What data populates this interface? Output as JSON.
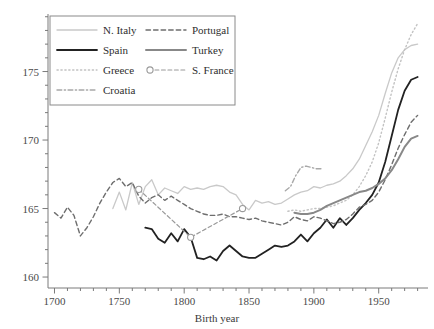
{
  "chart_data": {
    "type": "line",
    "title": "",
    "xlabel": "Birth year",
    "ylabel": "",
    "xlim": [
      1695,
      1988
    ],
    "ylim": [
      159.2,
      179.2
    ],
    "grid": false,
    "legend_position": "top-left",
    "xticks": [
      1700,
      1750,
      1800,
      1850,
      1900,
      1950
    ],
    "xtick_labels": [
      "1700",
      "1750",
      "1800",
      "1850",
      "1900",
      "1950"
    ],
    "xticks_minor_step": 10,
    "yticks": [
      160,
      165,
      170,
      175
    ],
    "ytick_labels": [
      "160",
      "165",
      "170",
      "175"
    ],
    "yticks_minor_step": 1,
    "units": "cm",
    "series": [
      {
        "name": "N. Italy",
        "color": "#c9c9c9",
        "dash": "solid",
        "width": 1.3,
        "marker": "none",
        "x": [
          1745,
          1750,
          1755,
          1760,
          1765,
          1770,
          1775,
          1780,
          1785,
          1790,
          1795,
          1800,
          1805,
          1810,
          1815,
          1820,
          1825,
          1830,
          1835,
          1840,
          1845,
          1850,
          1855,
          1860,
          1865,
          1870,
          1875,
          1880,
          1885,
          1890,
          1895,
          1900,
          1905,
          1910,
          1915,
          1920,
          1925,
          1930,
          1935,
          1940,
          1945,
          1950,
          1955,
          1960,
          1965,
          1970,
          1975,
          1980
        ],
        "y": [
          165.0,
          166.2,
          164.9,
          166.9,
          165.3,
          166.6,
          167.1,
          166.0,
          166.5,
          166.3,
          166.1,
          166.6,
          166.4,
          166.5,
          166.4,
          166.6,
          166.7,
          166.6,
          166.2,
          166.0,
          165.3,
          164.9,
          165.6,
          165.4,
          165.5,
          165.3,
          165.4,
          165.7,
          166.0,
          166.2,
          166.3,
          166.6,
          166.5,
          166.7,
          166.8,
          167.0,
          167.4,
          167.9,
          168.6,
          169.6,
          170.6,
          171.8,
          173.4,
          174.9,
          176.0,
          176.6,
          176.9,
          177.0
        ]
      },
      {
        "name": "Spain",
        "color": "#222222",
        "dash": "solid",
        "width": 1.8,
        "marker": "none",
        "x": [
          1770,
          1775,
          1780,
          1785,
          1790,
          1795,
          1800,
          1805,
          1810,
          1815,
          1820,
          1825,
          1830,
          1835,
          1840,
          1845,
          1850,
          1855,
          1860,
          1865,
          1870,
          1875,
          1880,
          1885,
          1890,
          1895,
          1900,
          1905,
          1910,
          1915,
          1920,
          1925,
          1930,
          1935,
          1940,
          1945,
          1950,
          1955,
          1960,
          1965,
          1970,
          1975,
          1980
        ],
        "y": [
          163.6,
          163.5,
          162.8,
          162.5,
          163.2,
          162.6,
          163.5,
          162.9,
          161.4,
          161.3,
          161.5,
          161.2,
          161.9,
          162.3,
          161.9,
          161.5,
          161.4,
          161.4,
          161.7,
          162.0,
          162.3,
          162.2,
          162.3,
          162.6,
          163.1,
          162.6,
          163.2,
          163.6,
          164.2,
          163.6,
          164.3,
          163.8,
          164.3,
          164.9,
          165.4,
          166.0,
          166.9,
          168.4,
          170.3,
          172.2,
          173.6,
          174.4,
          174.6
        ]
      },
      {
        "name": "Greece",
        "color": "#c2c2c2",
        "dash": "dotted",
        "width": 1.4,
        "marker": "none",
        "x": [
          1880,
          1885,
          1890,
          1895,
          1900,
          1905,
          1910,
          1915,
          1920,
          1925,
          1930,
          1935,
          1940,
          1945,
          1950,
          1955,
          1960,
          1965,
          1970,
          1975,
          1980
        ],
        "y": [
          164.8,
          164.9,
          164.8,
          164.9,
          165.0,
          165.0,
          165.1,
          165.2,
          165.4,
          165.6,
          166.0,
          166.6,
          167.4,
          168.4,
          169.8,
          171.6,
          173.5,
          175.2,
          176.6,
          177.7,
          178.5
        ]
      },
      {
        "name": "Croatia",
        "color": "#a8a8a8",
        "dash": "dashdot",
        "width": 1.4,
        "marker": "none",
        "x": [
          1878,
          1882,
          1886,
          1890,
          1894,
          1898,
          1902,
          1906
        ],
        "y": [
          166.3,
          166.6,
          167.4,
          168.0,
          168.1,
          168.0,
          167.9,
          167.9
        ]
      },
      {
        "name": "Portugal",
        "color": "#6e6e6e",
        "dash": "dashed",
        "width": 1.4,
        "marker": "none",
        "x": [
          1700,
          1705,
          1710,
          1715,
          1720,
          1725,
          1730,
          1735,
          1740,
          1745,
          1750,
          1755,
          1760,
          1765,
          1770,
          1775,
          1780,
          1785,
          1790,
          1795,
          1800,
          1805,
          1810,
          1815,
          1820,
          1825,
          1830,
          1835,
          1840,
          1845,
          1850,
          1855,
          1860,
          1865,
          1870,
          1875,
          1880,
          1885,
          1890,
          1895,
          1900,
          1905,
          1910,
          1915,
          1920,
          1925,
          1930,
          1935,
          1940,
          1945,
          1950,
          1955,
          1960,
          1965,
          1970,
          1975,
          1980
        ],
        "y": [
          164.7,
          164.3,
          165.1,
          164.5,
          163.0,
          163.6,
          164.4,
          165.4,
          166.2,
          166.9,
          167.2,
          166.6,
          166.9,
          165.9,
          165.4,
          165.8,
          166.0,
          165.6,
          165.9,
          165.6,
          165.3,
          165.0,
          164.8,
          164.6,
          164.5,
          164.5,
          164.6,
          164.4,
          164.4,
          164.3,
          164.2,
          164.3,
          164.1,
          164.0,
          163.9,
          163.8,
          164.0,
          164.4,
          164.2,
          164.1,
          164.4,
          164.3,
          164.1,
          163.9,
          164.0,
          164.2,
          164.6,
          165.1,
          165.3,
          165.6,
          166.2,
          167.1,
          168.2,
          169.4,
          170.4,
          171.3,
          171.8
        ]
      },
      {
        "name": "Turkey",
        "color": "#888888",
        "dash": "solid",
        "width": 2.0,
        "marker": "none",
        "x": [
          1885,
          1890,
          1895,
          1900,
          1905,
          1910,
          1915,
          1920,
          1925,
          1930,
          1935,
          1940,
          1945,
          1950,
          1955,
          1960,
          1965,
          1970,
          1975,
          1980
        ],
        "y": [
          164.7,
          164.6,
          164.6,
          164.7,
          164.9,
          165.2,
          165.4,
          165.6,
          165.8,
          166.0,
          166.2,
          166.3,
          166.5,
          166.8,
          167.2,
          167.8,
          168.6,
          169.5,
          170.1,
          170.3
        ]
      },
      {
        "name": "S. France",
        "color": "#9a9a9a",
        "dash": "dashed",
        "width": 1.2,
        "marker": "circle",
        "x": [
          1765,
          1805,
          1845
        ],
        "y": [
          166.4,
          162.9,
          165.0
        ]
      }
    ],
    "legend_entries": [
      {
        "label": "N. Italy",
        "color": "#c9c9c9",
        "dash": "solid",
        "width": 1.3,
        "marker": "none"
      },
      {
        "label": "Portugal",
        "color": "#6e6e6e",
        "dash": "dashed",
        "width": 1.4,
        "marker": "none"
      },
      {
        "label": "Spain",
        "color": "#222222",
        "dash": "solid",
        "width": 1.8,
        "marker": "none"
      },
      {
        "label": "Turkey",
        "color": "#888888",
        "dash": "solid",
        "width": 2.0,
        "marker": "none"
      },
      {
        "label": "Greece",
        "color": "#c2c2c2",
        "dash": "dotted",
        "width": 1.4,
        "marker": "none"
      },
      {
        "label": "S. France",
        "color": "#9a9a9a",
        "dash": "dashed",
        "width": 1.2,
        "marker": "circle"
      },
      {
        "label": "Croatia",
        "color": "#a8a8a8",
        "dash": "dashdot",
        "width": 1.4,
        "marker": "none"
      }
    ]
  }
}
